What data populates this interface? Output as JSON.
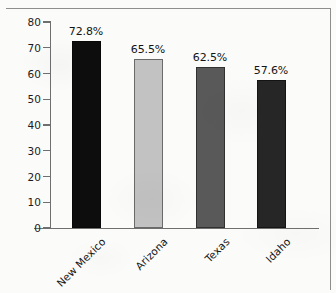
{
  "chart_data": {
    "type": "bar",
    "title": "",
    "subtitle": "",
    "xlabel": "",
    "ylabel": "",
    "categories": [
      "New Mexico",
      "Arizona",
      "Texas",
      "Idaho"
    ],
    "values": [
      72.8,
      65.5,
      62.5,
      57.6
    ],
    "value_labels": [
      "72.8%",
      "65.5%",
      "62.5%",
      "57.6%"
    ],
    "bar_colors": [
      "#0d0d0d",
      "#c2c2c2",
      "#595959",
      "#262626"
    ],
    "ylim": [
      0,
      80
    ],
    "ytick_labels": [
      "0",
      "10",
      "20",
      "30",
      "40",
      "50",
      "60",
      "70",
      "80"
    ],
    "ytick_values": [
      0,
      10,
      20,
      30,
      40,
      50,
      60,
      70,
      80
    ],
    "grid": false,
    "legend": null,
    "legend_position": "none",
    "annotations": []
  },
  "figure": {
    "frame_color": "#8e8e8e",
    "axis_color": "#6f6f6f",
    "background_color": "#fbfbfa",
    "text_color": "#141414"
  }
}
